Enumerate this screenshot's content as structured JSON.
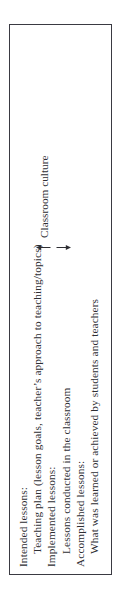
{
  "figure": {
    "orientation": "rotated-90-ccw",
    "border_color": "#3a3a42",
    "text_color": "#2e2e33",
    "background": "#ffffff",
    "lines": [
      {
        "text": "Intended lessons:",
        "indent": false
      },
      {
        "text": "Teaching plan (lesson goals, teacher’s approach to teaching/topics)",
        "indent": true
      },
      {
        "text": "Implemented lessons:",
        "indent": false
      },
      {
        "text": "Lessons conducted in the classroom",
        "indent": true
      },
      {
        "text": "Accomplished lessons:",
        "indent": false
      },
      {
        "text": "What was learned or achieved by students and teachers",
        "indent": true
      }
    ],
    "annotation": {
      "label": "Classroom culture",
      "arrow_up": "arrow-up-glyph",
      "arrow_down": "arrow-down-glyph"
    }
  }
}
